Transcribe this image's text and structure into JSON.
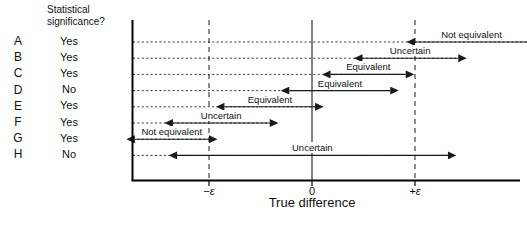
{
  "header": {
    "significance_header": "Statistical\nsignificance?"
  },
  "axis": {
    "x_title": "True difference",
    "ticks": [
      {
        "label": "−ε",
        "value": -1
      },
      {
        "label": "0",
        "value": 0
      },
      {
        "label": "+ε",
        "value": 1
      }
    ]
  },
  "chart_data": {
    "type": "line",
    "title": "",
    "subtitle": "",
    "xlabel": "True difference",
    "ylabel": "",
    "xlim": [
      -2.1,
      2.3
    ],
    "grid": false,
    "legend": null,
    "annotations": [
      "Equivalence bounds shown as dashed vertical lines at −ε and +ε",
      "Solid vertical reference line at 0",
      "Each row is a confidence interval drawn as a double-headed arrow"
    ],
    "equivalence_bounds": [
      -1,
      1
    ],
    "null_value": 0,
    "columns": [
      "study",
      "significant",
      "ci_low",
      "ci_high",
      "conclusion"
    ],
    "rows": [
      {
        "study": "A",
        "significant": "Yes",
        "ci_low": 1.0,
        "ci_high": 2.1,
        "conclusion": "Not equivalent"
      },
      {
        "study": "B",
        "significant": "Yes",
        "ci_low": 0.49,
        "ci_high": 1.42,
        "conclusion": "Uncertain"
      },
      {
        "study": "C",
        "significant": "Yes",
        "ci_low": 0.18,
        "ci_high": 0.91,
        "conclusion": "Equivalent"
      },
      {
        "study": "D",
        "significant": "No",
        "ci_low": -0.22,
        "ci_high": 0.76,
        "conclusion": "Equivalent"
      },
      {
        "study": "E",
        "significant": "Yes",
        "ci_low": -0.85,
        "ci_high": 0.03,
        "conclusion": "Equivalent"
      },
      {
        "study": "F",
        "significant": "Yes",
        "ci_low": -1.35,
        "ci_high": -0.41,
        "conclusion": "Uncertain"
      },
      {
        "study": "G",
        "significant": "Yes",
        "ci_low": -1.72,
        "ci_high": -1.0,
        "conclusion": "Not equivalent"
      },
      {
        "study": "H",
        "significant": "No",
        "ci_low": -1.31,
        "ci_high": 1.32,
        "conclusion": "Uncertain"
      }
    ]
  },
  "style": {
    "line_color": "#1a1a1a",
    "axis_color": "#000000",
    "background": "#ffffff"
  }
}
